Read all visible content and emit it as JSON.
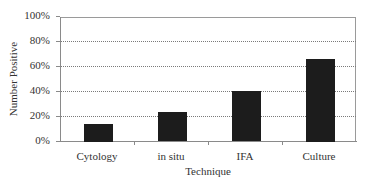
{
  "chart_data": {
    "type": "bar",
    "title": "",
    "xlabel": "Technique",
    "ylabel": "Number Positive",
    "categories": [
      "Cytology",
      "in situ",
      "IFA",
      "Culture"
    ],
    "values": [
      14,
      23,
      40,
      66
    ],
    "ylim": [
      0,
      100
    ],
    "yticks": [
      "0%",
      "20%",
      "40%",
      "60%",
      "80%",
      "100%"
    ],
    "grid": "horizontal dotted",
    "legend": "none",
    "bar_color": "#1c1c1c"
  }
}
